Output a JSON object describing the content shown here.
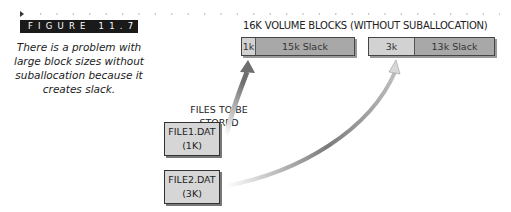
{
  "figure": {
    "label": "FIGURE 11.7",
    "caption": "There is a problem with large block sizes without suballocation because it creates slack."
  },
  "volume_blocks": {
    "title": "16K VOLUME BLOCKS (WITHOUT SUBALLOCATION)",
    "blocks": [
      {
        "used_label": "1k",
        "slack_label": "15k Slack",
        "used_kb": 1,
        "slack_kb": 15
      },
      {
        "used_label": "3k",
        "slack_label": "13k Slack",
        "used_kb": 3,
        "slack_kb": 13
      }
    ]
  },
  "files": {
    "title": "FILES TO BE STORED",
    "items": [
      {
        "name": "FILE1.DAT",
        "size": "(1K)"
      },
      {
        "name": "FILE2.DAT",
        "size": "(3K)"
      }
    ]
  },
  "colors": {
    "used": "#d2d2d2",
    "slack": "#a8a8a8",
    "label_bg": "#1a1a1a",
    "arrow": "#8a8a8a"
  }
}
